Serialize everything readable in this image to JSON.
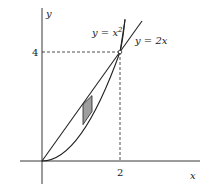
{
  "diagram": {
    "type": "region-between-curves",
    "axes": {
      "x_label": "x",
      "y_label": "y"
    },
    "curves": [
      {
        "id": "parabola",
        "equation": "y = x²",
        "label": "y = x",
        "label_sup": "2"
      },
      {
        "id": "line",
        "equation": "y = 2x",
        "label": "y = 2x"
      }
    ],
    "intersection": {
      "x": 2,
      "y": 4
    },
    "ticks": {
      "x_tick_label": "2",
      "y_tick_label": "4"
    },
    "shaded_strip": {
      "x_from": 1.05,
      "x_to": 1.28,
      "fill": "#9e9e9e"
    },
    "colors": {
      "stroke": "#222222",
      "shade": "#9e9e9e",
      "background": "#ffffff"
    }
  }
}
